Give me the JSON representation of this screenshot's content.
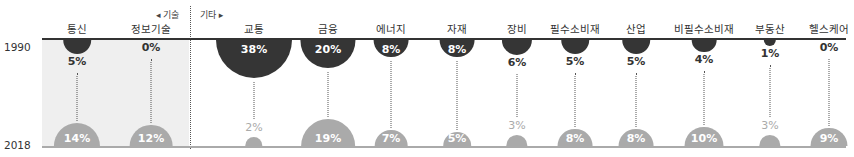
{
  "chart_data": {
    "type": "semicircle-comparison",
    "title": "",
    "years": [
      "1990",
      "2018"
    ],
    "groups": [
      {
        "label": "◂ 기술",
        "categories": [
          "통신",
          "정보기술"
        ]
      },
      {
        "label": "기타 ▸",
        "categories": [
          "교통",
          "금융",
          "에너지",
          "자재",
          "장비",
          "필수소비재",
          "산업",
          "비필수소비재",
          "부동산",
          "헬스케어"
        ]
      }
    ],
    "categories": [
      "통신",
      "정보기술",
      "교통",
      "금융",
      "에너지",
      "자재",
      "장비",
      "필수소비재",
      "산업",
      "비필수소비재",
      "부동산",
      "헬스케어"
    ],
    "series": [
      {
        "name": "1990",
        "values": [
          5,
          0,
          38,
          20,
          8,
          8,
          6,
          5,
          5,
          4,
          1,
          0
        ],
        "color": "#353535"
      },
      {
        "name": "2018",
        "values": [
          14,
          12,
          2,
          19,
          7,
          5,
          3,
          8,
          8,
          10,
          3,
          9
        ],
        "color": "#aaaaaa"
      }
    ],
    "unit": "%"
  },
  "labels": {
    "year_top": "1990",
    "year_bottom": "2018",
    "group_tech": "◂ 기술",
    "group_other": "기타 ▸"
  },
  "columns": [
    {
      "name": "통신",
      "v1990": "5%",
      "v2018": "14%"
    },
    {
      "name": "정보기술",
      "v1990": "0%",
      "v2018": "12%"
    },
    {
      "name": "교통",
      "v1990": "38%",
      "v2018": "2%"
    },
    {
      "name": "금융",
      "v1990": "20%",
      "v2018": "19%"
    },
    {
      "name": "에너지",
      "v1990": "8%",
      "v2018": "7%"
    },
    {
      "name": "자재",
      "v1990": "8%",
      "v2018": "5%"
    },
    {
      "name": "장비",
      "v1990": "6%",
      "v2018": "3%"
    },
    {
      "name": "필수소비재",
      "v1990": "5%",
      "v2018": "8%"
    },
    {
      "name": "산업",
      "v1990": "5%",
      "v2018": "8%"
    },
    {
      "name": "비필수소비재",
      "v1990": "4%",
      "v2018": "10%"
    },
    {
      "name": "부동산",
      "v1990": "1%",
      "v2018": "3%"
    },
    {
      "name": "헬스케어",
      "v1990": "0%",
      "v2018": "9%"
    }
  ],
  "colors": {
    "dark": "#353535",
    "light": "#aaaaaa",
    "tech_bg": "#efefef"
  }
}
